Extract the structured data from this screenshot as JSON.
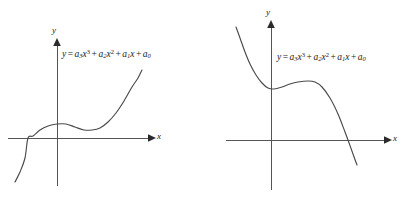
{
  "figure": {
    "background_color": "#ffffff",
    "stroke_color": "#4a4a4a",
    "axis_color": "#555555",
    "text_color": "#1a1a1a",
    "panel_count": 2
  },
  "panels": [
    {
      "id": "left",
      "x_axis_label": "x",
      "y_axis_label": "y",
      "equation": {
        "lhs": "y",
        "equals": "=",
        "terms": [
          {
            "coefficient": "a",
            "coef_sub": "3",
            "variable": "x",
            "power": "3"
          },
          {
            "coefficient": "a",
            "coef_sub": "2",
            "variable": "x",
            "power": "2"
          },
          {
            "coefficient": "a",
            "coef_sub": "1",
            "variable": "x",
            "power": ""
          },
          {
            "coefficient": "a",
            "coef_sub": "0",
            "variable": "",
            "power": ""
          }
        ],
        "plain_text": "y = a3x^3 + a2x^2 + a1x + a0"
      },
      "curve": {
        "shape": "increasing cubic with local maximum then local minimum",
        "leading_coefficient_sign": "positive"
      }
    },
    {
      "id": "right",
      "x_axis_label": "x",
      "y_axis_label": "y",
      "equation": {
        "lhs": "y",
        "equals": "=",
        "terms": [
          {
            "coefficient": "a",
            "coef_sub": "3",
            "variable": "x",
            "power": "3"
          },
          {
            "coefficient": "a",
            "coef_sub": "2",
            "variable": "x",
            "power": "2"
          },
          {
            "coefficient": "a",
            "coef_sub": "1",
            "variable": "x",
            "power": ""
          },
          {
            "coefficient": "a",
            "coef_sub": "0",
            "variable": "",
            "power": ""
          }
        ],
        "plain_text": "y = a3x^3 + a2x^2 + a1x + a0"
      },
      "curve": {
        "shape": "decreasing cubic with local minimum then local maximum",
        "leading_coefficient_sign": "negative"
      }
    }
  ],
  "chart_data": {
    "type": "line",
    "title": "",
    "xlabel": "x",
    "ylabel": "y",
    "grid": false,
    "legend": "none",
    "charts": [
      {
        "id": "left",
        "title": "",
        "xlabel": "x",
        "ylabel": "y",
        "annotation": "y = a3x^3 + a2x^2 + a1x + a0",
        "axis_origin_px": {
          "x": 57,
          "y": 138
        },
        "series": [
          {
            "name": "y = a3x^3 + a2x^2 + a1x + a0",
            "leading_coefficient_sign": "positive",
            "points_px": [
              [
                15,
                182
              ],
              [
                20,
                172
              ],
              [
                25,
                158
              ],
              [
                28,
                138
              ],
              [
                33,
                136
              ],
              [
                40,
                130
              ],
              [
                48,
                126
              ],
              [
                57,
                124
              ],
              [
                66,
                124
              ],
              [
                75,
                127
              ],
              [
                84,
                130
              ],
              [
                92,
                130
              ],
              [
                100,
                128
              ],
              [
                108,
                122
              ],
              [
                116,
                113
              ],
              [
                124,
                101
              ],
              [
                132,
                87
              ],
              [
                138,
                78
              ],
              [
                142,
                70
              ]
            ],
            "features": {
              "local_maximum_px": [
                58,
                123
              ],
              "local_minimum_px": [
                90,
                131
              ],
              "x_intercept_px": [
                28,
                138
              ]
            }
          }
        ]
      },
      {
        "id": "right",
        "title": "",
        "xlabel": "x",
        "ylabel": "y",
        "annotation": "y = a3x^3 + a2x^2 + a1x + a0",
        "axis_origin_px": {
          "x": 271,
          "y": 140
        },
        "series": [
          {
            "name": "y = a3x^3 + a2x^2 + a1x + a0",
            "leading_coefficient_sign": "negative",
            "points_px": [
              [
                236,
                27
              ],
              [
                240,
                38
              ],
              [
                245,
                52
              ],
              [
                250,
                64
              ],
              [
                256,
                75
              ],
              [
                262,
                83
              ],
              [
                268,
                88
              ],
              [
                274,
                89
              ],
              [
                282,
                87
              ],
              [
                290,
                84
              ],
              [
                298,
                82
              ],
              [
                308,
                81
              ],
              [
                315,
                82
              ],
              [
                322,
                87
              ],
              [
                330,
                98
              ],
              [
                338,
                114
              ],
              [
                345,
                132
              ],
              [
                348,
                140
              ],
              [
                353,
                154
              ],
              [
                357,
                165
              ]
            ],
            "features": {
              "local_minimum_px": [
                273,
                89
              ],
              "local_maximum_px": [
                313,
                81
              ],
              "x_intercept_px": [
                348,
                140
              ]
            }
          }
        ]
      }
    ]
  }
}
